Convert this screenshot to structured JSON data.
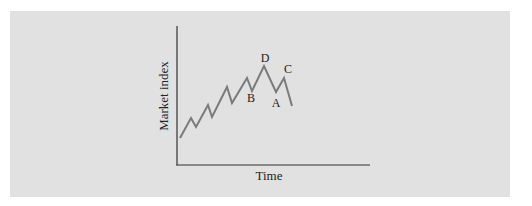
{
  "chart_data": {
    "type": "line",
    "title": "",
    "xlabel": "Time",
    "ylabel": "Market index",
    "grid": false,
    "legend": null,
    "axis": {
      "x_origin_px": 177,
      "y_origin_px": 165,
      "x_end_px": 370,
      "y_top_px": 26
    },
    "series": [
      {
        "name": "Market index",
        "color": "#7a7a7a",
        "points_px": [
          [
            180,
            138
          ],
          [
            191,
            118
          ],
          [
            196,
            127
          ],
          [
            208,
            105
          ],
          [
            212,
            117
          ],
          [
            227,
            87
          ],
          [
            232,
            103
          ],
          [
            247,
            78
          ],
          [
            252,
            91
          ],
          [
            264,
            66
          ],
          [
            276,
            92
          ],
          [
            284,
            78
          ],
          [
            292,
            106
          ]
        ]
      }
    ],
    "annotations": [
      {
        "text": "B",
        "x": 251,
        "y": 102
      },
      {
        "text": "D",
        "x": 265,
        "y": 62
      },
      {
        "text": "C",
        "x": 288,
        "y": 73
      },
      {
        "text": "A",
        "x": 276,
        "y": 107
      }
    ]
  },
  "colors": {
    "panel": "#e1e1e1",
    "axis": "#333333",
    "line": "#7a7a7a"
  }
}
